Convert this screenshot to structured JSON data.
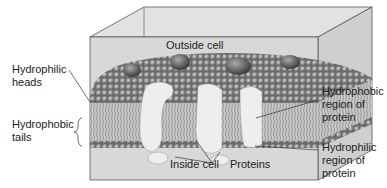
{
  "diagram": {
    "labels": {
      "outside_cell": "Outside cell",
      "inside_cell": "Inside cell",
      "hydrophilic_heads": "Hydrophilic\nheads",
      "hydrophobic_tails": "Hydrophobic\ntails",
      "hydrophobic_region": "Hydrophobic\nregion of\nprotein",
      "hydrophilic_region": "Hydrophilic\nregion of\nprotein",
      "proteins": "Proteins"
    },
    "colors": {
      "box_fill": "#d4d4d4",
      "box_edge": "#555555",
      "head": "#8a8a8a",
      "protein": "#eeeeee",
      "dark_protein": "#555555",
      "tails": "#9a9a9a"
    }
  }
}
